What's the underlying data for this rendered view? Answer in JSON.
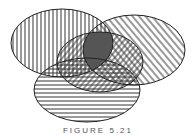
{
  "figure": {
    "type": "venn-diagram",
    "caption": "FIGURE 5.21",
    "sets": [
      {
        "id": "A",
        "position": "top-left",
        "pattern": "vertical-lines"
      },
      {
        "id": "B",
        "position": "top-right",
        "pattern": "diagonal-lines-down"
      },
      {
        "id": "C",
        "position": "center",
        "pattern": "diagonal-lines-up"
      },
      {
        "id": "D",
        "position": "bottom",
        "pattern": "horizontal-lines"
      }
    ],
    "highlighted_region": {
      "sets": [
        "A",
        "B",
        "C"
      ],
      "fill": "#555555"
    },
    "colors": {
      "stroke": "#222222",
      "hatch": "#333333",
      "highlight": "#555555",
      "background": "#ffffff"
    }
  }
}
